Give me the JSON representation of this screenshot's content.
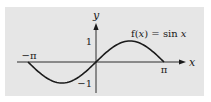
{
  "colors": {
    "panel_bg": "#e6e6e6",
    "page_bg": "#ffffff",
    "axis": "#1a1a1a",
    "curve": "#1a1a1a"
  },
  "labels": {
    "function": "f(x) = sin x",
    "x_axis": "x",
    "y_axis": "y",
    "x_min": "−π",
    "x_max": "π",
    "y_max": "1",
    "y_min": "−1"
  },
  "chart_data": {
    "type": "line",
    "title": "",
    "annotation": "f(x) = sin x",
    "xlabel": "x",
    "ylabel": "y",
    "xlim": [
      -3.6,
      4.1
    ],
    "ylim": [
      -1.25,
      1.55
    ],
    "x_tick_labels": [
      "−π",
      "π"
    ],
    "y_tick_labels": [
      "1",
      "−1"
    ],
    "grid": false,
    "legend": null,
    "series": [
      {
        "name": "f(x) = sin x",
        "function": "sin(x)",
        "domain": [
          -3.14159,
          3.14159
        ],
        "x": [
          -3.1416,
          -2.3562,
          -1.5708,
          -0.7854,
          0,
          0.7854,
          1.5708,
          2.3562,
          3.1416
        ],
        "values": [
          0,
          -0.7071,
          -1,
          -0.7071,
          0,
          0.7071,
          1,
          0.7071,
          0
        ]
      }
    ]
  }
}
